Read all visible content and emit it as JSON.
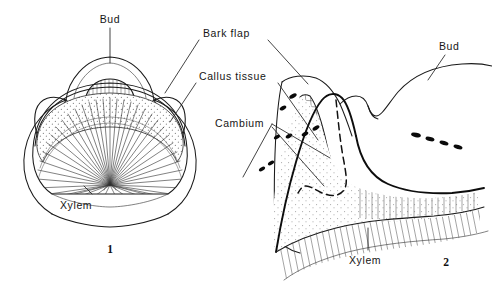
{
  "figure": {
    "background_color": "#ffffff",
    "ink_color": "#1a1a1a",
    "width": 492,
    "height": 287
  },
  "panels": [
    {
      "id": "panel-1",
      "number": "1",
      "caption": "1",
      "view": "cross-section",
      "labels": [
        {
          "key": "bud",
          "text": "Bud"
        },
        {
          "key": "xylem",
          "text": "Xylem"
        }
      ]
    },
    {
      "id": "panel-2",
      "number": "2",
      "caption": "2",
      "view": "longitudinal-section",
      "labels": [
        {
          "key": "bud",
          "text": "Bud"
        },
        {
          "key": "xylem",
          "text": "Xylem"
        }
      ]
    }
  ],
  "labels": {
    "bud_left": "Bud",
    "bark_flap": "Bark flap",
    "callus_tissue": "Callus tissue",
    "cambium": "Cambium",
    "bud_right": "Bud",
    "xylem_left": "Xylem",
    "xylem_right": "Xylem",
    "fig_one": "1",
    "fig_two": "2"
  },
  "legend_terms": [
    "Bud",
    "Bark flap",
    "Callus tissue",
    "Cambium",
    "Xylem"
  ],
  "textures": {
    "callus_fill": "stipple",
    "xylem_fill": "radiating-rays",
    "bark_fill": "cross-hatch",
    "lenticel_marks": 9
  }
}
